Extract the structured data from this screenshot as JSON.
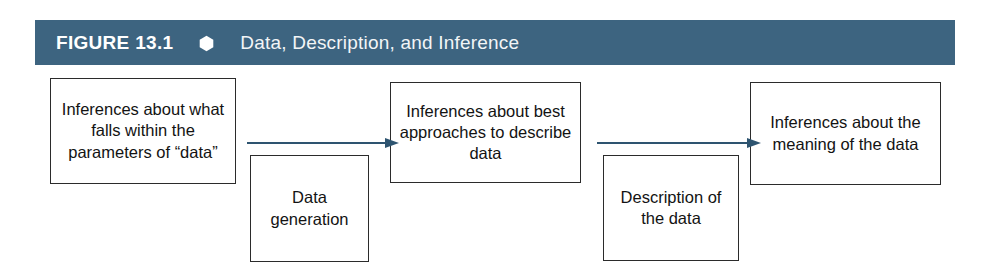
{
  "figure": {
    "label": "FIGURE 13.1",
    "title": "Data, Description, and Inference",
    "icon": "hexagon-icon",
    "header_color": "#3d6480",
    "header_text_color": "#ffffff",
    "arrow_color": "#2e5470",
    "box_border_color": "#2b2b2b",
    "box_text_color": "#131313",
    "background_color": "#ffffff"
  },
  "flow": {
    "boxes": [
      {
        "id": "inferences-data",
        "text": "Inferences about what falls within the parameters of “data”",
        "row": "top"
      },
      {
        "id": "data-generation",
        "text": "Data generation",
        "row": "bottom"
      },
      {
        "id": "inferences-approaches",
        "text": "Inferences about best approaches to describe data",
        "row": "top"
      },
      {
        "id": "description-data",
        "text": "Description of the data",
        "row": "bottom"
      },
      {
        "id": "inferences-meaning",
        "text": "Inferences about the meaning of the data",
        "row": "top"
      }
    ],
    "arrows": [
      {
        "id": "arrow-one",
        "from": "inferences-data",
        "to": "inferences-approaches",
        "direction": "right"
      },
      {
        "id": "arrow-two",
        "from": "inferences-approaches",
        "to": "inferences-meaning",
        "direction": "right"
      }
    ]
  }
}
